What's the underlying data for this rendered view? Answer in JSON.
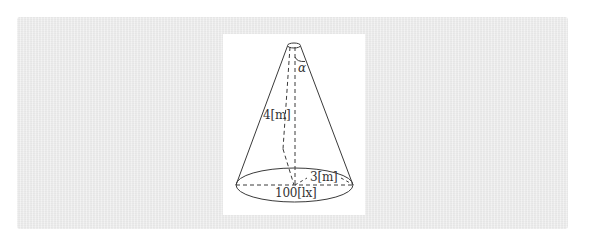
{
  "diagram": {
    "labels": {
      "angle": "α",
      "height": "4[m]",
      "radius": "3[m]",
      "illuminance": "100[lx]"
    },
    "colors": {
      "panel_background": "#ececec",
      "figure_background": "#ffffff",
      "stroke": "#3a3a3a",
      "text": "#333333"
    }
  }
}
